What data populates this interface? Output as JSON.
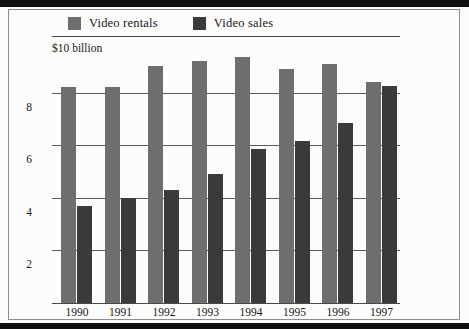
{
  "chart_data": {
    "type": "bar",
    "title": "",
    "subtitle": "",
    "xlabel": "",
    "ylabel": "$10 billion",
    "unit_caption": "$10 billion",
    "categories": [
      "1990",
      "1991",
      "1992",
      "1993",
      "1994",
      "1995",
      "1996",
      "1997"
    ],
    "series": [
      {
        "name": "Video rentals",
        "color": "#6e6e6e",
        "values": [
          8.2,
          8.2,
          9.0,
          9.2,
          9.35,
          8.9,
          9.1,
          8.4
        ]
      },
      {
        "name": "Video sales",
        "color": "#3a3a3a",
        "values": [
          3.7,
          4.0,
          4.3,
          4.9,
          5.85,
          6.15,
          6.85,
          8.25
        ]
      }
    ],
    "ylim": [
      0,
      10
    ],
    "yticks": [
      2,
      4,
      6,
      8
    ],
    "ytick_labels": [
      "2",
      "4",
      "6",
      "8"
    ],
    "grid": true,
    "legend_position": "top-left",
    "value_unit": "billions of dollars"
  },
  "legend": {
    "items": [
      {
        "label": "Video rentals",
        "swatch_color": "#6e6e6e"
      },
      {
        "label": "Video sales",
        "swatch_color": "#3a3a3a"
      }
    ]
  },
  "axis": {
    "unit_caption": "$10 billion"
  }
}
